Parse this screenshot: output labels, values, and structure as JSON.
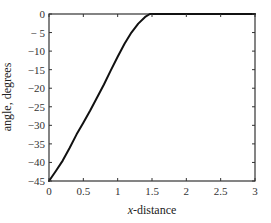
{
  "chart_data": {
    "type": "line",
    "title": "",
    "xlabel": "x-distance",
    "xlabel_italic_part": "x",
    "xlabel_rest": "-distance",
    "ylabel": "angle, degrees",
    "xlim": [
      0,
      3
    ],
    "ylim": [
      -45,
      0
    ],
    "xticks": [
      0,
      0.5,
      1,
      1.5,
      2,
      2.5,
      3
    ],
    "xtick_labels": [
      "0",
      "0.5",
      "1",
      "1.5",
      "2",
      "2.5",
      "3"
    ],
    "yticks": [
      0,
      -5,
      -10,
      -15,
      -20,
      -25,
      -30,
      -35,
      -40,
      -45
    ],
    "ytick_labels": [
      "0",
      "− 5",
      "−10",
      "−15",
      "−20",
      "−25",
      "−30",
      "−35",
      "−40",
      "−45"
    ],
    "grid": false,
    "legend": null,
    "series": [
      {
        "name": "angle",
        "color": "#111111",
        "x": [
          0,
          0.1,
          0.2,
          0.3,
          0.4,
          0.5,
          0.6,
          0.7,
          0.8,
          0.9,
          1.0,
          1.1,
          1.2,
          1.3,
          1.4,
          1.47,
          1.5,
          2.0,
          2.5,
          3.0
        ],
        "y": [
          -45,
          -42.3,
          -39.5,
          -36.1,
          -32.5,
          -29.3,
          -26,
          -22.5,
          -19,
          -15.2,
          -11.5,
          -8,
          -5,
          -2.6,
          -0.8,
          0,
          0,
          0,
          0,
          0
        ]
      }
    ]
  }
}
